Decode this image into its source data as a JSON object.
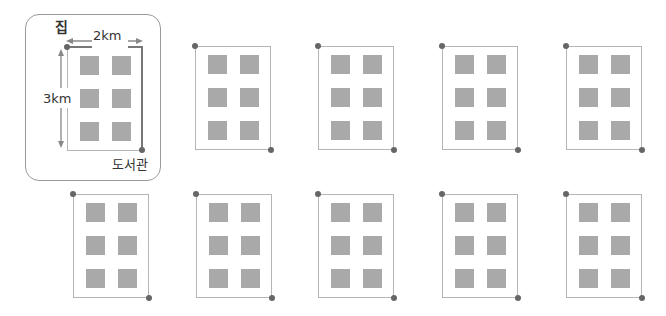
{
  "example": {
    "start_label": "집",
    "end_label": "도서관",
    "width_label": "2km",
    "height_label": "3km"
  },
  "colors": {
    "outline": "#b5b5b5",
    "path": "#777777",
    "square": "#a9a9a9",
    "dot": "#666666",
    "frame": "#9a9a9a"
  },
  "grid": {
    "rows": 2,
    "panels_row1": 4,
    "panels_row2": 5,
    "squares_per_block": 6
  }
}
